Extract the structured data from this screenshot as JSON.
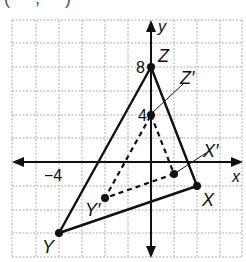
{
  "header_fragment": "( , )",
  "axes": {
    "x_label": "x",
    "y_label": "y",
    "x_tick_label": "−4",
    "y_tick_labels": [
      "8",
      "4"
    ]
  },
  "triangle_original": {
    "style": "solid",
    "vertices": [
      {
        "label": "Z",
        "x": 0,
        "y": 8
      },
      {
        "label": "X",
        "x": 2,
        "y": -2
      },
      {
        "label": "Y",
        "x": -4,
        "y": -6
      }
    ]
  },
  "triangle_image": {
    "style": "dashed",
    "vertices": [
      {
        "label": "Z′",
        "x": 0,
        "y": 4
      },
      {
        "label": "X′",
        "x": 1,
        "y": -1
      },
      {
        "label": "Y′",
        "x": -2,
        "y": -3
      }
    ]
  },
  "grid": {
    "columns": 10,
    "x_units_per_square": 1,
    "y_units_per_square": 2
  },
  "colors": {
    "line": "#111111",
    "grid": "#9a9a9a",
    "background": "#ffffff"
  }
}
